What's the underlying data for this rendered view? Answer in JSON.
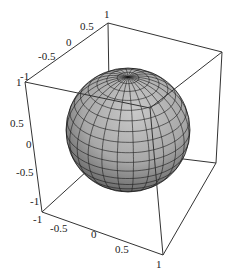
{
  "chart_data": {
    "type": "surface3d",
    "title": "",
    "surface": "unit sphere x^2+y^2+z^2=1",
    "mesh": {
      "latitude_bands": 18,
      "longitude_bands": 24
    },
    "shading": "grayscale lighting",
    "axes": {
      "x": {
        "ticks": [
          "-1",
          "-0.5",
          "0",
          "0.5",
          "1"
        ],
        "range": [
          -1,
          1
        ],
        "label": ""
      },
      "y": {
        "ticks": [
          "-1",
          "-0.5",
          "0",
          "0.5",
          "1"
        ],
        "range": [
          -1,
          1
        ],
        "label": ""
      },
      "z": {
        "ticks": [
          "-1",
          "-0.5",
          "0",
          "0.5",
          "1"
        ],
        "range": [
          -1,
          1
        ],
        "label": ""
      }
    },
    "boxed": true,
    "grid": false,
    "legend": null
  },
  "labels": {
    "top": [
      "-1",
      "-0.5",
      "0",
      "0.5",
      "1"
    ],
    "left": [
      "1",
      "0.5",
      "0",
      "-0.5",
      "-1"
    ],
    "bottom": [
      "-1",
      "-0.5",
      "0",
      "0.5",
      "1"
    ]
  }
}
